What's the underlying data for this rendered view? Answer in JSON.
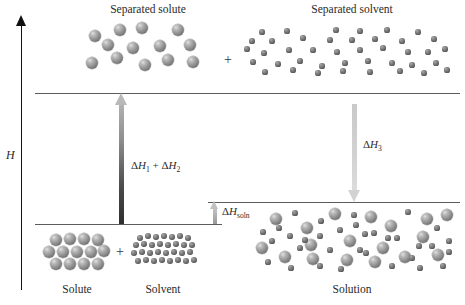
{
  "figure": {
    "type": "enthalpy-diagram",
    "axis": {
      "label": "H",
      "name": "enthalpy-axis",
      "direction": "up"
    }
  },
  "labels": {
    "separated_solute": "Separated solute",
    "separated_solvent": "Separated solvent",
    "solute": "Solute",
    "solvent": "Solvent",
    "solution": "Solution",
    "plus_top": "+",
    "plus_bottom": "+"
  },
  "steps": [
    {
      "id": "dh12",
      "label_html": "Δ<i>H</i><sub>1</sub> + Δ<i>H</i><sub>2</sub>",
      "label_text": "ΔH1 + ΔH2",
      "direction": "up",
      "color": "#4a4a4a"
    },
    {
      "id": "dh3",
      "label_html": "Δ<i>H</i><sub>3</sub>",
      "label_text": "ΔH3",
      "direction": "down",
      "color": "#d2d2d2"
    },
    {
      "id": "dhsoln",
      "label_html": "Δ<i>H</i><sub>soln</sub>",
      "label_text": "ΔHsoln",
      "direction": "up",
      "color": "#c0c0c0"
    }
  ],
  "levels": [
    {
      "id": "separated",
      "y": 93,
      "x1": 35,
      "x2": 460
    },
    {
      "id": "solution",
      "y": 202,
      "x1": 208,
      "x2": 460
    },
    {
      "id": "reactants",
      "y": 224,
      "x1": 35,
      "x2": 222
    }
  ],
  "chart_data": {
    "type": "diagram",
    "ylabel": "H",
    "states": [
      {
        "name": "Solute + Solvent",
        "relative_enthalpy": 0
      },
      {
        "name": "Separated solute + Separated solvent",
        "relative_enthalpy": 131
      },
      {
        "name": "Solution",
        "relative_enthalpy": 22
      }
    ],
    "transitions": [
      {
        "label": "ΔH1 + ΔH2",
        "from": "Solute + Solvent",
        "to": "Separated solute + Separated solvent",
        "sign": "positive"
      },
      {
        "label": "ΔH3",
        "from": "Separated solute + Separated solvent",
        "to": "Solution",
        "sign": "negative"
      },
      {
        "label": "ΔHsoln",
        "from": "Solute + Solvent",
        "to": "Solution",
        "sign": "positive"
      }
    ]
  },
  "particles": {
    "separated_solute": {
      "radius": 6.2,
      "points": [
        [
          95,
          36
        ],
        [
          120,
          30
        ],
        [
          142,
          28
        ],
        [
          178,
          30
        ],
        [
          108,
          45
        ],
        [
          133,
          48
        ],
        [
          160,
          46
        ],
        [
          190,
          45
        ],
        [
          92,
          63
        ],
        [
          117,
          58
        ],
        [
          145,
          65
        ],
        [
          168,
          60
        ],
        [
          193,
          62
        ]
      ]
    },
    "separated_solvent": {
      "radius": 2.6,
      "points": [
        [
          262,
          32
        ],
        [
          287,
          31
        ],
        [
          336,
          30
        ],
        [
          360,
          31
        ],
        [
          387,
          30
        ],
        [
          418,
          32
        ],
        [
          252,
          41
        ],
        [
          272,
          41
        ],
        [
          303,
          38
        ],
        [
          330,
          40
        ],
        [
          352,
          40
        ],
        [
          375,
          39
        ],
        [
          402,
          41
        ],
        [
          434,
          39
        ],
        [
          247,
          49
        ],
        [
          264,
          53
        ],
        [
          289,
          50
        ],
        [
          313,
          50
        ],
        [
          337,
          52
        ],
        [
          360,
          50
        ],
        [
          383,
          48
        ],
        [
          408,
          52
        ],
        [
          428,
          52
        ],
        [
          445,
          49
        ],
        [
          253,
          62
        ],
        [
          278,
          64
        ],
        [
          300,
          61
        ],
        [
          322,
          66
        ],
        [
          345,
          63
        ],
        [
          368,
          61
        ],
        [
          392,
          63
        ],
        [
          412,
          65
        ],
        [
          436,
          63
        ],
        [
          265,
          72
        ],
        [
          293,
          70
        ],
        [
          318,
          73
        ],
        [
          343,
          71
        ],
        [
          370,
          72
        ],
        [
          400,
          71
        ],
        [
          424,
          73
        ],
        [
          447,
          70
        ]
      ]
    },
    "solute_crystal": {
      "radius": 6.4,
      "points": [
        [
          56,
          240
        ],
        [
          70,
          239
        ],
        [
          84,
          239
        ],
        [
          98,
          240
        ],
        [
          49,
          252
        ],
        [
          63,
          252
        ],
        [
          77,
          252
        ],
        [
          91,
          252
        ],
        [
          104,
          251
        ],
        [
          56,
          264
        ],
        [
          70,
          264
        ],
        [
          84,
          264
        ],
        [
          98,
          264
        ]
      ]
    },
    "solvent_cluster": {
      "radius": 2.7,
      "points": [
        [
          140,
          238
        ],
        [
          148,
          236
        ],
        [
          156,
          237
        ],
        [
          164,
          236
        ],
        [
          172,
          237
        ],
        [
          180,
          236
        ],
        [
          188,
          238
        ],
        [
          136,
          245
        ],
        [
          144,
          244
        ],
        [
          152,
          245
        ],
        [
          160,
          244
        ],
        [
          168,
          245
        ],
        [
          176,
          244
        ],
        [
          184,
          245
        ],
        [
          192,
          245
        ],
        [
          134,
          253
        ],
        [
          142,
          252
        ],
        [
          150,
          253
        ],
        [
          158,
          252
        ],
        [
          166,
          253
        ],
        [
          174,
          252
        ],
        [
          182,
          253
        ],
        [
          190,
          252
        ],
        [
          138,
          261
        ],
        [
          146,
          260
        ],
        [
          154,
          261
        ],
        [
          162,
          260
        ],
        [
          170,
          261
        ],
        [
          178,
          260
        ],
        [
          186,
          261
        ],
        [
          194,
          260
        ]
      ]
    },
    "solution_large": {
      "radius": 6.0,
      "points": [
        [
          276,
          219
        ],
        [
          307,
          228
        ],
        [
          335,
          214
        ],
        [
          371,
          217
        ],
        [
          391,
          226
        ],
        [
          427,
          219
        ],
        [
          350,
          241
        ],
        [
          311,
          245
        ],
        [
          383,
          248
        ],
        [
          423,
          237
        ],
        [
          447,
          215
        ],
        [
          285,
          257
        ],
        [
          313,
          259
        ],
        [
          347,
          260
        ],
        [
          375,
          262
        ],
        [
          405,
          257
        ],
        [
          438,
          255
        ],
        [
          262,
          248
        ]
      ]
    },
    "solution_small": {
      "radius": 2.6,
      "points": [
        [
          295,
          213
        ],
        [
          321,
          221
        ],
        [
          356,
          225
        ],
        [
          408,
          212
        ],
        [
          437,
          228
        ],
        [
          263,
          232
        ],
        [
          290,
          236
        ],
        [
          320,
          236
        ],
        [
          340,
          230
        ],
        [
          365,
          234
        ],
        [
          397,
          238
        ],
        [
          419,
          246
        ],
        [
          449,
          241
        ],
        [
          272,
          241
        ],
        [
          300,
          248
        ],
        [
          330,
          250
        ],
        [
          360,
          250
        ],
        [
          388,
          238
        ],
        [
          412,
          258
        ],
        [
          443,
          266
        ],
        [
          268,
          262
        ],
        [
          291,
          268
        ],
        [
          320,
          266
        ],
        [
          341,
          269
        ],
        [
          366,
          253
        ],
        [
          392,
          266
        ],
        [
          420,
          268
        ],
        [
          449,
          252
        ],
        [
          305,
          240
        ],
        [
          374,
          233
        ],
        [
          432,
          246
        ],
        [
          279,
          228
        ],
        [
          354,
          215
        ]
      ]
    }
  }
}
